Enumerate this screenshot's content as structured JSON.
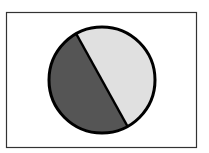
{
  "diagram": {
    "frame": {
      "x": 6,
      "y": 12,
      "width": 190,
      "height": 135,
      "stroke": "#333333"
    },
    "circle": {
      "cx": 102,
      "cy": 80,
      "r": 53,
      "stroke": "#000000",
      "stroke_width": 3
    },
    "regions": [
      {
        "name": "dark-segment",
        "fill": "#555555"
      },
      {
        "name": "light-segment",
        "fill": "#e0e0e0"
      }
    ],
    "chord": {
      "x1": 75,
      "y1": 32,
      "x2": 127,
      "y2": 125
    }
  }
}
